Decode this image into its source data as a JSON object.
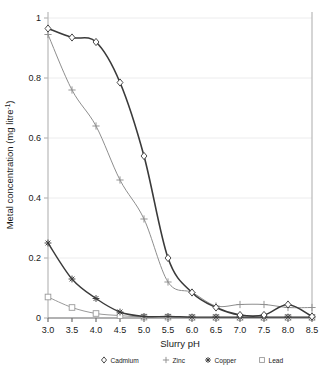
{
  "chart_data": {
    "type": "line",
    "title": "",
    "xlabel": "Slurry pH",
    "ylabel_main": "Metal concentration (mg litre",
    "ylabel_sup": "-1",
    "ylabel_tail": ")",
    "ylabel_full": "Metal concentration (mg litre-1)",
    "x": [
      3.0,
      3.5,
      4.0,
      4.5,
      5.0,
      5.5,
      6.0,
      6.5,
      7.0,
      7.5,
      8.0,
      8.5
    ],
    "xtick_labels": [
      "3.0",
      "3.5",
      "4.0",
      "4.5",
      "5.0",
      "5.5",
      "6.0",
      "6.5",
      "7.0",
      "7.5",
      "8.0",
      "8.5"
    ],
    "xlim": [
      3.0,
      8.5
    ],
    "ylim": [
      0,
      1
    ],
    "ytick_values": [
      0,
      0.2,
      0.4,
      0.6,
      0.8,
      1
    ],
    "ytick_labels": [
      "0",
      "0.2",
      "0.4",
      "0.6",
      "0.8",
      "1"
    ],
    "grid": "horizontal-light",
    "legend_position": "below-axis",
    "series": [
      {
        "name": "Cadmium",
        "marker": "diamond",
        "color": "#3a3a3a",
        "line_width": 1.6,
        "values": [
          0.965,
          0.935,
          0.92,
          0.785,
          0.54,
          0.2,
          0.085,
          0.035,
          0.01,
          0.01,
          0.045,
          0.005
        ]
      },
      {
        "name": "Zinc",
        "marker": "plus",
        "color": "#8e8e8e",
        "line_width": 1.0,
        "values": [
          0.945,
          0.76,
          0.64,
          0.46,
          0.33,
          0.12,
          0.085,
          0.04,
          0.045,
          0.045,
          0.035,
          0.035
        ]
      },
      {
        "name": "Copper",
        "marker": "asterisk",
        "color": "#3a3a3a",
        "line_width": 1.4,
        "values": [
          0.25,
          0.13,
          0.065,
          0.02,
          0.005,
          0.005,
          0.003,
          0.003,
          0.003,
          0.003,
          0.003,
          0.003
        ]
      },
      {
        "name": "Lead",
        "marker": "square",
        "color": "#9a9a9a",
        "line_width": 1.0,
        "values": [
          0.07,
          0.035,
          0.015,
          0.008,
          0.003,
          0.003,
          0.002,
          0.002,
          0.002,
          0.002,
          0.002,
          0.002
        ]
      }
    ],
    "legend": [
      {
        "label": "Cadmium",
        "marker": "diamond",
        "color": "#3a3a3a"
      },
      {
        "label": "Zinc",
        "marker": "plus",
        "color": "#8e8e8e"
      },
      {
        "label": "Copper",
        "marker": "asterisk",
        "color": "#3a3a3a"
      },
      {
        "label": "Lead",
        "marker": "square",
        "color": "#9a9a9a"
      }
    ],
    "axis_color": "#b9b9b9",
    "grid_color": "#ececed"
  }
}
